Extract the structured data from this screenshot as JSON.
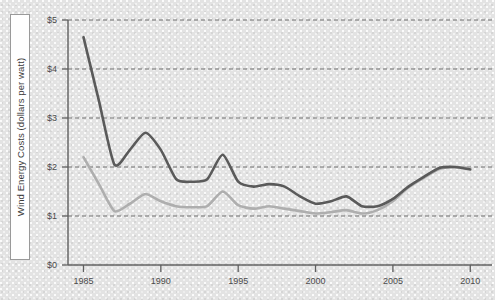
{
  "chart_data": {
    "type": "line",
    "title": "",
    "xlabel": "",
    "ylabel": "Wind Energy Costs (dollars per watt)",
    "xlim": [
      1984,
      2010.5
    ],
    "ylim": [
      0,
      5
    ],
    "grid": true,
    "legend": "none",
    "y_ticks": [
      {
        "value": 0,
        "label": "$0"
      },
      {
        "value": 1,
        "label": "$1"
      },
      {
        "value": 2,
        "label": "$2"
      },
      {
        "value": 3,
        "label": "$3"
      },
      {
        "value": 4,
        "label": "$4"
      },
      {
        "value": 5,
        "label": "$5"
      }
    ],
    "x_ticks": [
      {
        "value": 1985,
        "label": "1985"
      },
      {
        "value": 1990,
        "label": "1990"
      },
      {
        "value": 1995,
        "label": "1995"
      },
      {
        "value": 2000,
        "label": "2000"
      },
      {
        "value": 2005,
        "label": "2005"
      },
      {
        "value": 2010,
        "label": "2010"
      }
    ],
    "x": [
      1985,
      1986,
      1987,
      1988,
      1989,
      1990,
      1991,
      1992,
      1993,
      1994,
      1995,
      1996,
      1997,
      1998,
      1999,
      2000,
      2001,
      2002,
      2003,
      2004,
      2005,
      2006,
      2007,
      2008,
      2009,
      2010
    ],
    "series": [
      {
        "name": "upper-cost-line",
        "color": "#5a5a5a",
        "width": 2.6,
        "values": [
          4.65,
          3.35,
          2.05,
          2.35,
          2.7,
          2.35,
          1.75,
          1.7,
          1.75,
          2.25,
          1.7,
          1.6,
          1.65,
          1.6,
          1.4,
          1.25,
          1.3,
          1.4,
          1.2,
          1.2,
          1.35,
          1.6,
          1.8,
          1.98,
          2.0,
          1.95
        ]
      },
      {
        "name": "lower-cost-line",
        "color": "#aeaeae",
        "width": 2.6,
        "values": [
          2.2,
          1.65,
          1.1,
          1.25,
          1.45,
          1.3,
          1.2,
          1.18,
          1.2,
          1.5,
          1.22,
          1.15,
          1.2,
          1.15,
          1.1,
          1.05,
          1.08,
          1.12,
          1.05,
          1.12,
          1.3,
          1.58,
          1.78,
          1.96,
          2.0,
          1.98
        ]
      }
    ]
  },
  "colors": {
    "background": "#e3e3e3",
    "dark_series": "#5a5a5a",
    "light_series": "#aeaeae",
    "axis": "#5f5f5f",
    "gridline": "#6f6f6f",
    "label_box_fill": "#ffffff"
  }
}
